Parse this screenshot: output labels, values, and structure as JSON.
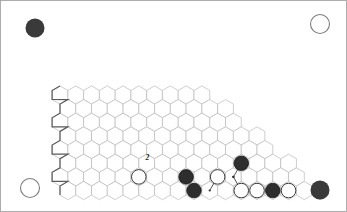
{
  "figure": {
    "name": "hex-board-diagram",
    "board_shape": "rhombus-hex-grid",
    "frame_color": "#9a9a9a",
    "background": "#ffffff"
  },
  "colors": {
    "black_stone": "#2e2e2e",
    "white_stone": "#ffffff",
    "shaded_region": "#a7a7a7",
    "grid_line": "#b9b9b9",
    "edge_line": "#5b5b5b"
  },
  "column_labels": [
    "A",
    "B",
    "C",
    "D",
    "E",
    "F",
    "G",
    "H",
    "I",
    "J",
    "K"
  ],
  "row_labels": [
    "1",
    "2",
    "3",
    "4",
    "5",
    "6",
    "7",
    "8",
    "9",
    "10",
    "11"
  ],
  "corner_markers": [
    {
      "name": "corner-top-left",
      "color": "black"
    },
    {
      "name": "corner-top-right",
      "color": "white"
    },
    {
      "name": "corner-bottom-left",
      "color": "white"
    },
    {
      "name": "corner-bottom-right",
      "color": "black"
    }
  ],
  "numbered_stones": [
    {
      "label": "2",
      "color": "white"
    },
    {
      "label": "1",
      "color": "black"
    }
  ],
  "stones": {
    "black_count": 11,
    "white_count": 9
  },
  "regions": [
    {
      "name": "shaded-region-upper-right",
      "cells": 19,
      "fill": "#a7a7a7"
    },
    {
      "name": "shaded-region-lower-center",
      "cells": 2,
      "fill": "#b3b3b3"
    }
  ],
  "annotations": {
    "arrow_count": 7,
    "highlighted_stone": "white-stone-at-region-corner"
  }
}
